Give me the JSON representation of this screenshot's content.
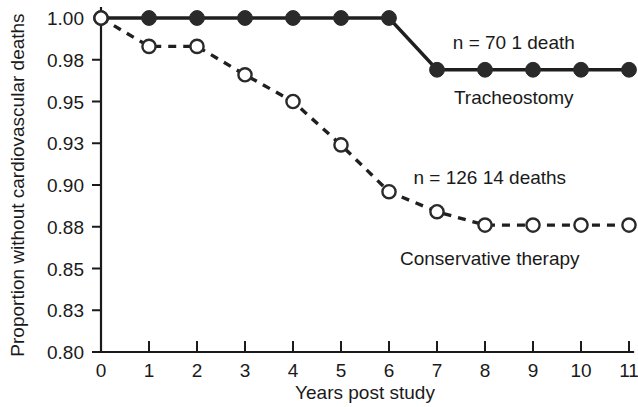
{
  "chart_data": {
    "type": "line",
    "title": "",
    "xlabel": "Years post study",
    "ylabel": "Proportion without cardiovascular deaths",
    "x": [
      0,
      1,
      2,
      3,
      4,
      5,
      6,
      7,
      8,
      9,
      10,
      11
    ],
    "xlim": [
      0,
      11
    ],
    "ylim": [
      0.8,
      1.0
    ],
    "xticks": [
      "0",
      "1",
      "2",
      "3",
      "4",
      "5",
      "6",
      "7",
      "8",
      "9",
      "10",
      "11"
    ],
    "yticks": [
      "1.00",
      "0.98",
      "0.95",
      "0.93",
      "0.90",
      "0.88",
      "0.85",
      "0.83",
      "0.80"
    ],
    "ytick_values": [
      1.0,
      0.975,
      0.95,
      0.925,
      0.9,
      0.875,
      0.85,
      0.825,
      0.8
    ],
    "grid": false,
    "legend_position": "inline-annotations",
    "series": [
      {
        "name": "Tracheostomy",
        "marker": "filled-circle",
        "linestyle": "solid",
        "color": "#1f1f1f",
        "x": [
          0,
          1,
          2,
          3,
          4,
          5,
          6,
          7,
          8,
          9,
          10,
          11
        ],
        "values": [
          1.0,
          1.0,
          1.0,
          1.0,
          1.0,
          1.0,
          1.0,
          0.969,
          0.969,
          0.969,
          0.969,
          0.969
        ]
      },
      {
        "name": "Conservative therapy",
        "marker": "open-circle",
        "linestyle": "dashed",
        "color": "#1f1f1f",
        "x": [
          0,
          1,
          2,
          3,
          4,
          5,
          6,
          7,
          8,
          9,
          10,
          11
        ],
        "values": [
          1.0,
          0.983,
          0.983,
          0.966,
          0.95,
          0.924,
          0.896,
          0.884,
          0.876,
          0.876,
          0.876,
          0.876
        ]
      }
    ],
    "annotations": [
      {
        "id": "tracheostomy-stats",
        "text": "n = 70   1 death",
        "x": 8.6,
        "y": 0.9855
      },
      {
        "id": "tracheostomy-label",
        "text": "Tracheostomy",
        "x": 8.6,
        "y": 0.9525
      },
      {
        "id": "conservative-stats",
        "text": "n = 126  14 deaths",
        "x": 8.1,
        "y": 0.9045
      },
      {
        "id": "conservative-label",
        "text": "Conservative therapy",
        "x": 8.1,
        "y": 0.8565
      }
    ]
  }
}
